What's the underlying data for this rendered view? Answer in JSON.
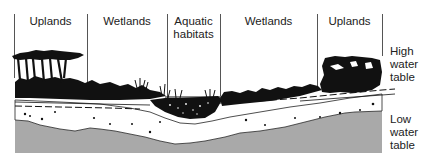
{
  "diagram": {
    "zones": [
      {
        "label": "Uplands",
        "x_start": 14,
        "x_end": 87
      },
      {
        "label": "Wetlands",
        "x_start": 87,
        "x_end": 167
      },
      {
        "label_line1": "Aquatic",
        "label_line2": "habitats",
        "x_start": 167,
        "x_end": 220
      },
      {
        "label": "Wetlands",
        "x_start": 220,
        "x_end": 317
      },
      {
        "label": "Uplands",
        "x_start": 317,
        "x_end": 382
      }
    ],
    "water_table_labels": {
      "high": {
        "line1": "High",
        "line2": "water",
        "line3": "table"
      },
      "low": {
        "line1": "Low",
        "line2": "water",
        "line3": "table"
      }
    },
    "colors": {
      "vegetation": "#111111",
      "soil": "#ffffff",
      "bedrock": "#a9a9a9",
      "divider": "#555555",
      "text": "#222222"
    }
  }
}
